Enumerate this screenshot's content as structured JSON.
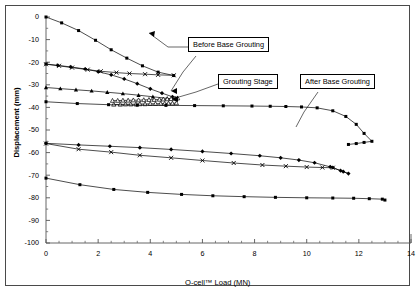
{
  "figure": {
    "background": "#ffffff",
    "frame_color": "#4a4a4a",
    "line_color": "#000000"
  },
  "annotations": [
    {
      "id": "before",
      "label": "Before Base Grouting"
    },
    {
      "id": "stage",
      "label": "Grouting Stage"
    },
    {
      "id": "after",
      "label": "After Base Grouting"
    }
  ],
  "chart_data": {
    "type": "line",
    "title": "",
    "xlabel": "O-cell™ Load (MN)",
    "ylabel": "Displacement (mm)",
    "xlim": [
      0,
      14
    ],
    "ylim": [
      -100,
      0
    ],
    "xticks": [
      0,
      2,
      4,
      6,
      8,
      10,
      12,
      14
    ],
    "yticks": [
      0,
      -10,
      -20,
      -30,
      -40,
      -50,
      -60,
      -70,
      -80,
      -90,
      -100
    ],
    "xtick_labels": [
      "0",
      "2",
      "4",
      "6",
      "8",
      "10",
      "12",
      "14"
    ],
    "ytick_labels": [
      "0",
      "-10",
      "-20",
      "-30",
      "-40",
      "-50",
      "-60",
      "-70",
      "-80",
      "-90",
      "-100"
    ],
    "grid": false,
    "legend": "none",
    "minor_ticks": true,
    "series": [
      {
        "name": "Before Base Grouting - upward (top)",
        "group": "before",
        "marker": "square",
        "x": [
          0.0,
          0.6,
          1.25,
          1.9,
          2.5,
          3.1,
          3.7,
          4.3,
          4.9
        ],
        "y": [
          0.0,
          -2.6,
          -6.0,
          -10.3,
          -14.5,
          -18.2,
          -21.6,
          -24.4,
          -25.9
        ]
      },
      {
        "name": "Before Base Grouting - downward A",
        "group": "before",
        "marker": "diamond",
        "x": [
          0.0,
          0.45,
          0.95,
          1.5,
          2.0,
          2.5,
          3.0,
          3.5,
          4.0,
          4.45,
          4.85
        ],
        "y": [
          -20.8,
          -21.4,
          -22.1,
          -23.0,
          -24.2,
          -25.6,
          -27.4,
          -29.5,
          -31.8,
          -33.7,
          -35.3
        ]
      },
      {
        "name": "Before Base Grouting - downward B",
        "group": "before",
        "marker": "cross",
        "x": [
          0.0,
          0.5,
          1.0,
          1.6,
          2.1,
          2.7,
          3.2,
          3.8,
          4.3,
          4.9
        ],
        "y": [
          -20.9,
          -21.6,
          -22.4,
          -23.3,
          -24.0,
          -24.6,
          -25.0,
          -25.3,
          -25.6,
          -25.8
        ]
      },
      {
        "name": "Before Base Grouting - downward C",
        "group": "before",
        "marker": "triangle",
        "x": [
          0.0,
          0.55,
          1.15,
          1.75,
          2.35,
          2.95,
          3.55,
          4.1,
          4.65,
          5.0
        ],
        "y": [
          -31.2,
          -31.7,
          -32.2,
          -32.7,
          -33.3,
          -33.9,
          -34.6,
          -35.3,
          -36.0,
          -36.4
        ]
      },
      {
        "name": "Grouting Stage - cluster upper",
        "group": "stage",
        "marker": "triangle-open",
        "x": [
          2.55,
          2.75,
          2.95,
          3.15,
          3.35,
          3.55,
          3.75,
          3.95,
          4.15,
          4.35,
          4.5,
          4.65,
          4.8,
          4.95,
          5.05
        ],
        "y": [
          -37.0,
          -37.0,
          -36.9,
          -36.9,
          -36.8,
          -36.8,
          -36.7,
          -36.6,
          -36.6,
          -36.5,
          -36.4,
          -36.3,
          -36.2,
          -36.0,
          -35.9
        ]
      },
      {
        "name": "Grouting Stage - cluster lower",
        "group": "stage",
        "marker": "triangle-open",
        "x": [
          2.6,
          2.85,
          3.05,
          3.25,
          3.45,
          3.6,
          3.8,
          4.0,
          4.2,
          4.4,
          4.55,
          4.7,
          4.85,
          5.0
        ],
        "y": [
          -38.7,
          -38.7,
          -38.6,
          -38.6,
          -38.6,
          -38.5,
          -38.5,
          -38.4,
          -38.4,
          -38.3,
          -38.3,
          -38.2,
          -38.2,
          -38.1
        ]
      },
      {
        "name": "After Base Grouting - shallow",
        "group": "after",
        "marker": "square",
        "x": [
          0.0,
          1.2,
          2.4,
          3.5,
          4.6,
          5.7,
          6.8,
          7.9,
          8.6,
          9.2,
          9.8,
          10.4,
          11.0,
          11.5,
          11.9,
          12.2,
          12.5,
          12.2,
          11.9,
          11.6
        ],
        "y": [
          -37.5,
          -38.3,
          -38.8,
          -39.0,
          -39.1,
          -39.2,
          -39.3,
          -39.4,
          -39.5,
          -39.6,
          -39.8,
          -40.2,
          -41.5,
          -44.0,
          -47.5,
          -51.5,
          -55.0,
          -55.5,
          -56.0,
          -56.4
        ]
      },
      {
        "name": "After Base Grouting - middle upper",
        "group": "after",
        "marker": "diamond",
        "x": [
          0.0,
          1.25,
          2.45,
          3.6,
          4.8,
          6.0,
          7.1,
          8.2,
          9.0,
          9.7,
          10.3,
          10.9,
          11.4,
          11.6,
          11.3,
          11.0
        ],
        "y": [
          -55.9,
          -56.6,
          -57.2,
          -57.8,
          -58.6,
          -59.5,
          -60.4,
          -61.4,
          -62.3,
          -63.3,
          -64.5,
          -66.3,
          -68.4,
          -69.3,
          -68.0,
          -66.6
        ]
      },
      {
        "name": "After Base Grouting - middle lower",
        "group": "after",
        "marker": "cross",
        "x": [
          0.0,
          1.25,
          2.5,
          3.6,
          4.8,
          6.0,
          7.2,
          8.3,
          9.2,
          10.0,
          10.6,
          11.0
        ],
        "y": [
          -56.0,
          -58.5,
          -59.8,
          -61.2,
          -62.3,
          -63.5,
          -64.6,
          -65.5,
          -66.0,
          -66.4,
          -66.6,
          -66.7
        ]
      },
      {
        "name": "After Base Grouting - deep",
        "group": "after",
        "marker": "square",
        "x": [
          0.0,
          1.3,
          2.6,
          3.9,
          5.2,
          6.4,
          7.6,
          8.8,
          10.0,
          11.0,
          11.8,
          12.4,
          12.9,
          13.0
        ],
        "y": [
          -71.3,
          -74.2,
          -76.3,
          -77.6,
          -78.5,
          -79.1,
          -79.5,
          -79.8,
          -80.0,
          -80.1,
          -80.2,
          -80.4,
          -80.6,
          -81.0
        ]
      }
    ]
  }
}
